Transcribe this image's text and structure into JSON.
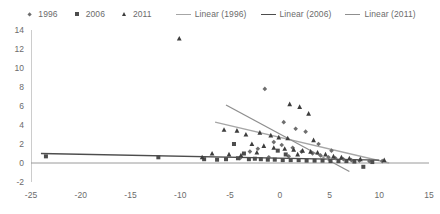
{
  "legend": {
    "items": [
      {
        "label": "1996",
        "marker": "diamond-marker-icon"
      },
      {
        "label": "2006",
        "marker": "square-marker-icon"
      },
      {
        "label": "2011",
        "marker": "triangle-marker-icon"
      },
      {
        "label": "Linear (1996)",
        "marker": "line-swatch-icon"
      },
      {
        "label": "Linear (2006)",
        "marker": "line-swatch-icon"
      },
      {
        "label": "Linear (2011)",
        "marker": "line-swatch-icon"
      }
    ]
  },
  "colors": {
    "series_1996": "#6e6e6e",
    "series_2006": "#4d4d4d",
    "series_2011": "#3d3d3d",
    "trend_1996": "#a6a6a6",
    "trend_2006": "#4d4d4d",
    "trend_2011": "#8f8f8f",
    "axis": "#9a9a9a",
    "text": "#6b6b6b"
  },
  "axes": {
    "x_ticks": [
      "-25",
      "-20",
      "-15",
      "-10",
      "-5",
      "0",
      "5",
      "10",
      "15"
    ],
    "y_ticks": [
      "14",
      "12",
      "10",
      "8",
      "6",
      "4",
      "2",
      "0",
      "-2"
    ],
    "xlim": [
      -25,
      15
    ],
    "ylim": [
      -2,
      14
    ]
  },
  "chart_data": {
    "type": "scatter",
    "title": "",
    "xlabel": "",
    "ylabel": "",
    "xlim": [
      -25,
      15
    ],
    "ylim": [
      -2,
      14
    ],
    "grid": false,
    "legend_position": "top",
    "series": [
      {
        "name": "1996",
        "marker": "diamond",
        "color": "#6e6e6e",
        "points": [
          [
            -1.5,
            7.8
          ],
          [
            0.4,
            4.3
          ],
          [
            1.6,
            3.6
          ],
          [
            2.6,
            3.3
          ],
          [
            -0.6,
            2.2
          ],
          [
            0.2,
            1.9
          ],
          [
            1.3,
            1.6
          ],
          [
            2.2,
            1.2
          ],
          [
            3.3,
            1.0
          ],
          [
            4.1,
            0.8
          ],
          [
            4.9,
            0.6
          ],
          [
            5.6,
            0.5
          ],
          [
            -2.2,
            1.5
          ],
          [
            -3.0,
            1.2
          ],
          [
            6.4,
            0.4
          ],
          [
            7.2,
            0.3
          ],
          [
            8.0,
            0.25
          ],
          [
            9.0,
            0.2
          ],
          [
            10.3,
            0.2
          ],
          [
            3.9,
            2.0
          ],
          [
            5.2,
            1.3
          ],
          [
            0.9,
            0.7
          ],
          [
            -1.1,
            0.6
          ],
          [
            -4.0,
            0.5
          ]
        ]
      },
      {
        "name": "2006",
        "marker": "square",
        "color": "#4d4d4d",
        "points": [
          [
            -23.5,
            0.7
          ],
          [
            -12.2,
            0.6
          ],
          [
            -7.6,
            0.4
          ],
          [
            -6.3,
            0.35
          ],
          [
            -5.4,
            0.4
          ],
          [
            -4.6,
            2.0
          ],
          [
            -4.2,
            0.5
          ],
          [
            -3.6,
            1.0
          ],
          [
            -3.1,
            0.4
          ],
          [
            -2.5,
            0.45
          ],
          [
            -1.9,
            0.4
          ],
          [
            -1.2,
            0.35
          ],
          [
            -0.5,
            0.35
          ],
          [
            0.3,
            0.3
          ],
          [
            1.1,
            0.3
          ],
          [
            1.9,
            0.3
          ],
          [
            2.7,
            0.25
          ],
          [
            3.5,
            0.25
          ],
          [
            4.3,
            0.25
          ],
          [
            5.1,
            0.2
          ],
          [
            5.9,
            0.2
          ],
          [
            6.7,
            0.2
          ],
          [
            7.5,
            0.15
          ],
          [
            8.4,
            -0.4
          ],
          [
            9.3,
            0.1
          ],
          [
            -0.2,
            1.3
          ],
          [
            0.6,
            0.9
          ]
        ]
      },
      {
        "name": "2011",
        "marker": "triangle",
        "color": "#3d3d3d",
        "points": [
          [
            -10.1,
            13.1
          ],
          [
            1.0,
            6.2
          ],
          [
            2.0,
            5.9
          ],
          [
            2.9,
            5.2
          ],
          [
            -5.6,
            3.5
          ],
          [
            -4.3,
            3.4
          ],
          [
            -3.4,
            3.0
          ],
          [
            -2.0,
            3.2
          ],
          [
            -0.9,
            2.9
          ],
          [
            -0.1,
            2.7
          ],
          [
            0.8,
            2.6
          ],
          [
            -2.8,
            2.0
          ],
          [
            -1.6,
            1.8
          ],
          [
            -0.6,
            1.6
          ],
          [
            0.5,
            1.5
          ],
          [
            1.4,
            1.4
          ],
          [
            2.3,
            1.3
          ],
          [
            3.1,
            1.2
          ],
          [
            3.8,
            1.1
          ],
          [
            -6.8,
            1.0
          ],
          [
            -5.1,
            0.9
          ],
          [
            -3.9,
            0.8
          ],
          [
            4.6,
            0.9
          ],
          [
            5.4,
            0.7
          ],
          [
            6.2,
            0.6
          ],
          [
            7.0,
            0.5
          ],
          [
            8.1,
            0.4
          ],
          [
            10.5,
            0.3
          ],
          [
            -7.8,
            0.6
          ],
          [
            -2.3,
            1.1
          ],
          [
            1.8,
            0.9
          ],
          [
            3.4,
            2.4
          ]
        ]
      }
    ],
    "trendlines": [
      {
        "name": "Linear (1996)",
        "color": "#a6a6a6",
        "x0": -6.5,
        "y0": 4.3,
        "x1": 11.0,
        "y1": 0.0
      },
      {
        "name": "Linear (2006)",
        "color": "#4d4d4d",
        "x0": -24.0,
        "y0": 1.0,
        "x1": 10.0,
        "y1": 0.3
      },
      {
        "name": "Linear (2011)",
        "color": "#8f8f8f",
        "x0": -5.4,
        "y0": 6.1,
        "x1": 7.0,
        "y1": -0.9
      }
    ]
  }
}
